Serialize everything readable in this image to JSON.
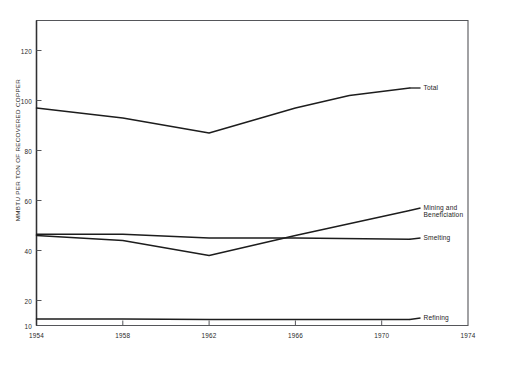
{
  "chart_data": {
    "type": "line",
    "title": "",
    "subtitle": "",
    "xlabel": "",
    "ylabel": "MMBTU PER TON OF RECOVERED COPPER",
    "xlim": [
      1954,
      1974
    ],
    "ylim": [
      10,
      132
    ],
    "xticks": [
      1954,
      1958,
      1962,
      1966,
      1970,
      1974
    ],
    "xtick_labels": [
      "1954",
      "1958",
      "1962",
      "1966",
      "1970",
      "1974"
    ],
    "yticks": [
      10,
      20,
      40,
      60,
      80,
      100,
      120
    ],
    "ytick_labels": [
      "10",
      "20",
      "40",
      "60",
      "80",
      "100",
      "120"
    ],
    "grid": false,
    "legend_position": "right-inline-labels",
    "line_color": "#1d1d1d",
    "axis_color": "#55565a",
    "background": "#ffffff",
    "series": [
      {
        "name": "Total",
        "label": "Total",
        "x": [
          1954,
          1958,
          1962,
          1966,
          1968.5,
          1971.3
        ],
        "values": [
          97,
          93,
          87,
          97,
          102,
          105
        ],
        "label_x": 1971.8,
        "label_y": 105
      },
      {
        "name": "Mining and Beneficiation",
        "label": "Mining and\nBeneficiation",
        "x": [
          1954,
          1958,
          1962,
          1966,
          1971.3
        ],
        "values": [
          46,
          44,
          38,
          46,
          56
        ],
        "label_x": 1971.8,
        "label_y": 57
      },
      {
        "name": "Smelting",
        "label": "Smelting",
        "x": [
          1954,
          1958,
          1962,
          1966,
          1971.3
        ],
        "values": [
          46.5,
          46.5,
          45,
          45,
          44.5
        ],
        "label_x": 1971.8,
        "label_y": 45
      },
      {
        "name": "Refining",
        "label": "Refining",
        "x": [
          1954,
          1958,
          1962,
          1966,
          1971.3
        ],
        "values": [
          12.6,
          12.6,
          12.4,
          12.4,
          12.4
        ],
        "label_x": 1971.8,
        "label_y": 13
      }
    ]
  }
}
